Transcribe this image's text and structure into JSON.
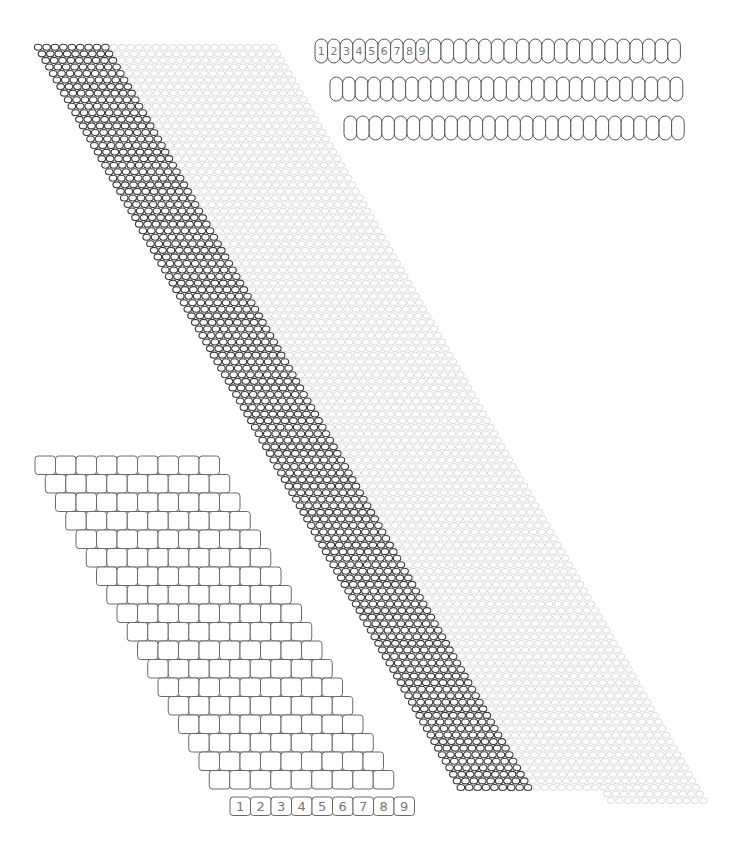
{
  "diagram": {
    "colors": {
      "background": "#ffffff",
      "dark_bead_stroke": "#3a3a3a",
      "light_bead_stroke": "#d6d6d6",
      "oval_stroke": "#555555",
      "grid_stroke": "#6a6a6a",
      "label_color": "#777777"
    },
    "oval_rows": {
      "bead_width": 12.6,
      "bead_height": 24,
      "rows": [
        {
          "x": 315,
          "y": 39,
          "count": 29,
          "labels": [
            "1",
            "2",
            "3",
            "4",
            "5",
            "6",
            "7",
            "8",
            "9"
          ]
        },
        {
          "x": 330,
          "y": 77,
          "count": 28,
          "labels": []
        },
        {
          "x": 344,
          "y": 116,
          "count": 27,
          "labels": []
        }
      ]
    },
    "diagonal_band": {
      "start_x": 34,
      "start_y": 44,
      "row_count": 114,
      "row_pitch": 6.55,
      "row_shift": 3.74,
      "bead_width": 8.4,
      "bead_height": 6.6,
      "dark_beads_per_row": 9,
      "light_beads_per_row": 20,
      "extra_light_rows": 2
    },
    "square_grid": {
      "start_x": 35,
      "start_y": 456,
      "cols": 9,
      "rows": 18,
      "cell_width": 20.5,
      "cell_height": 18.5,
      "row_shift": 10.25,
      "corner_radius": 3,
      "numbered_row": {
        "x": 230,
        "y": 797,
        "labels": [
          "1",
          "2",
          "3",
          "4",
          "5",
          "6",
          "7",
          "8",
          "9"
        ]
      }
    }
  }
}
